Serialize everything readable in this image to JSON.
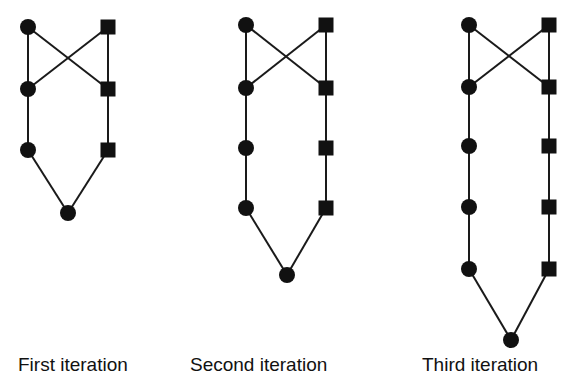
{
  "figure": {
    "style": {
      "stroke": "#1a1a1a",
      "fill": "#111111",
      "background": "#ffffff",
      "node_radius": 8,
      "square_size": 15,
      "line_width": 2
    },
    "graphs": [
      {
        "id": "first",
        "circles": [
          [
            28,
            27
          ],
          [
            28,
            89
          ],
          [
            28,
            150
          ]
        ],
        "squares": [
          [
            108,
            27
          ],
          [
            108,
            89
          ],
          [
            108,
            150
          ]
        ],
        "bottom": [
          68,
          213
        ]
      },
      {
        "id": "second",
        "circles": [
          [
            246,
            25
          ],
          [
            246,
            88
          ],
          [
            246,
            148
          ],
          [
            246,
            208
          ]
        ],
        "squares": [
          [
            326,
            25
          ],
          [
            326,
            88
          ],
          [
            326,
            148
          ],
          [
            326,
            208
          ]
        ],
        "bottom": [
          287,
          275
        ]
      },
      {
        "id": "third",
        "circles": [
          [
            469,
            25
          ],
          [
            469,
            87
          ],
          [
            469,
            146
          ],
          [
            469,
            207
          ],
          [
            469,
            269
          ]
        ],
        "squares": [
          [
            549,
            25
          ],
          [
            549,
            87
          ],
          [
            549,
            146
          ],
          [
            549,
            207
          ],
          [
            549,
            269
          ]
        ],
        "bottom": [
          511,
          340
        ]
      }
    ],
    "captions": [
      {
        "text": "First iteration",
        "x": 18
      },
      {
        "text": "Second iteration",
        "x": 190
      },
      {
        "text": "Third iteration",
        "x": 422
      }
    ]
  }
}
